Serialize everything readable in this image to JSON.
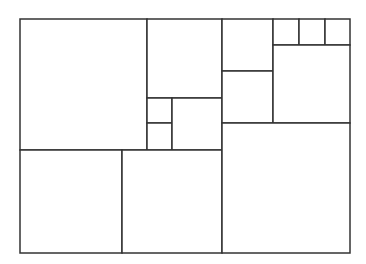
{
  "diagram": {
    "title": "",
    "stroke_color": "#333333",
    "fill_color": "#ffffff",
    "stroke_width": 1.5,
    "rects": [
      {
        "id": "r1",
        "x": 20,
        "y": 19,
        "w": 127,
        "h": 131
      },
      {
        "id": "r2",
        "x": 147,
        "y": 19,
        "w": 75,
        "h": 79
      },
      {
        "id": "r3",
        "x": 147,
        "y": 98,
        "w": 25,
        "h": 25
      },
      {
        "id": "r4",
        "x": 147,
        "y": 123,
        "w": 25,
        "h": 27
      },
      {
        "id": "r5",
        "x": 172,
        "y": 98,
        "w": 50,
        "h": 52
      },
      {
        "id": "r6",
        "x": 222,
        "y": 19,
        "w": 51,
        "h": 52
      },
      {
        "id": "r7",
        "x": 222,
        "y": 71,
        "w": 51,
        "h": 52
      },
      {
        "id": "r8",
        "x": 273,
        "y": 19,
        "w": 26,
        "h": 26
      },
      {
        "id": "r9",
        "x": 299,
        "y": 19,
        "w": 26,
        "h": 26
      },
      {
        "id": "r10",
        "x": 325,
        "y": 19,
        "w": 25,
        "h": 26
      },
      {
        "id": "r11",
        "x": 273,
        "y": 45,
        "w": 77,
        "h": 78
      },
      {
        "id": "r12",
        "x": 20,
        "y": 150,
        "w": 102,
        "h": 103
      },
      {
        "id": "r13",
        "x": 122,
        "y": 150,
        "w": 100,
        "h": 103
      },
      {
        "id": "r14",
        "x": 222,
        "y": 123,
        "w": 128,
        "h": 130
      }
    ]
  }
}
